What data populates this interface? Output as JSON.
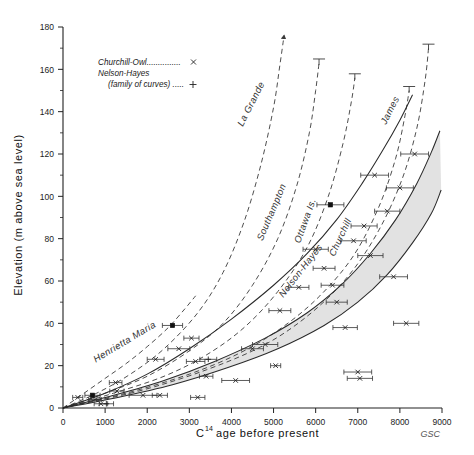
{
  "figure": {
    "credit": "GSC"
  },
  "legend": {
    "entries": [
      {
        "label": "Churchill-Owl...............",
        "marker": "x-marker-icon"
      },
      {
        "label": "Nelson-Hayes",
        "marker": ""
      },
      {
        "label": "(family of curves) .....",
        "marker": "plus-marker-icon"
      }
    ]
  },
  "chart_data": {
    "type": "line",
    "title": "",
    "xlabel": "C14 age before present",
    "xlabel_base": "C",
    "xlabel_sup": "14",
    "xlabel_rest": "age before present",
    "ylabel": "Elevation (m above sea level)",
    "xlim": [
      0,
      9000
    ],
    "ylim": [
      0,
      180
    ],
    "xticks": [
      0,
      1000,
      2000,
      3000,
      4000,
      5000,
      6000,
      7000,
      8000,
      9000
    ],
    "xtick_labels": [
      "0",
      "1000",
      "2000",
      "3000",
      "4000",
      "5000",
      "6000",
      "7000",
      "8000",
      "9000"
    ],
    "yticks": [
      0,
      20,
      40,
      60,
      80,
      100,
      120,
      140,
      160,
      180
    ],
    "ytick_labels": [
      "0",
      "20",
      "40",
      "60",
      "80",
      "100",
      "120",
      "140",
      "160",
      "180"
    ],
    "yticks_minor": [
      10,
      30,
      50,
      70,
      90,
      110,
      130,
      150,
      170
    ],
    "grid": false,
    "legend_position": "upper-left-inset",
    "series": [
      {
        "name": "Henrietta Maria",
        "style": "dashed",
        "label_x": 1500,
        "label_y": 30,
        "label_angle": -31,
        "points": [
          [
            0,
            0
          ],
          [
            500,
            7
          ],
          [
            1000,
            14
          ],
          [
            1500,
            21
          ],
          [
            2000,
            29
          ],
          [
            2500,
            38
          ],
          [
            2900,
            47
          ],
          [
            3150,
            53
          ]
        ]
      },
      {
        "name": "La Grande",
        "style": "dashed",
        "label_x": 4530,
        "label_y": 143,
        "label_angle": -63,
        "arrow_end": true,
        "points": [
          [
            0,
            0
          ],
          [
            800,
            7
          ],
          [
            1600,
            16
          ],
          [
            2400,
            28
          ],
          [
            3200,
            45
          ],
          [
            3800,
            64
          ],
          [
            4300,
            88
          ],
          [
            4700,
            115
          ],
          [
            5000,
            142
          ],
          [
            5150,
            162
          ],
          [
            5250,
            176
          ]
        ]
      },
      {
        "name": "Southampton",
        "style": "dashed",
        "cap_end": true,
        "label_x": 5020,
        "label_y": 92,
        "label_angle": -67,
        "points": [
          [
            0,
            0
          ],
          [
            1000,
            7
          ],
          [
            2000,
            15
          ],
          [
            3000,
            27
          ],
          [
            3800,
            40
          ],
          [
            4500,
            58
          ],
          [
            5100,
            80
          ],
          [
            5550,
            105
          ],
          [
            5850,
            130
          ],
          [
            6000,
            150
          ],
          [
            6080,
            163
          ]
        ]
      },
      {
        "name": "Ottawa Is.",
        "style": "dashed",
        "cap_end": true,
        "label_x": 5820,
        "label_y": 88,
        "label_angle": -70,
        "points": [
          [
            0,
            0
          ],
          [
            1200,
            7
          ],
          [
            2400,
            15
          ],
          [
            3400,
            25
          ],
          [
            4300,
            38
          ],
          [
            5100,
            55
          ],
          [
            5800,
            76
          ],
          [
            6300,
            100
          ],
          [
            6650,
            125
          ],
          [
            6850,
            145
          ],
          [
            6930,
            156
          ]
        ]
      },
      {
        "name": "Churchill",
        "style": "dashed",
        "cap_end": true,
        "label_x": 6650,
        "label_y": 80,
        "label_angle": -65,
        "points": [
          [
            0,
            0
          ],
          [
            1500,
            7
          ],
          [
            3000,
            16
          ],
          [
            4200,
            26
          ],
          [
            5200,
            38
          ],
          [
            6100,
            53
          ],
          [
            6900,
            72
          ],
          [
            7500,
            95
          ],
          [
            7900,
            118
          ],
          [
            8120,
            138
          ],
          [
            8220,
            150
          ]
        ]
      },
      {
        "name": "James",
        "style": "dashed",
        "cap_end": true,
        "label_x": 7830,
        "label_y": 140,
        "label_angle": -63,
        "points": [
          [
            0,
            0
          ],
          [
            1800,
            8
          ],
          [
            3400,
            18
          ],
          [
            4800,
            30
          ],
          [
            5900,
            45
          ],
          [
            6800,
            63
          ],
          [
            7500,
            84
          ],
          [
            8050,
            108
          ],
          [
            8400,
            132
          ],
          [
            8600,
            155
          ],
          [
            8680,
            170
          ]
        ]
      },
      {
        "name": "Churchill-Owl",
        "style": "solid",
        "points": [
          [
            0,
            0
          ],
          [
            1000,
            7
          ],
          [
            2000,
            16
          ],
          [
            3000,
            28
          ],
          [
            4000,
            42
          ],
          [
            5000,
            58
          ],
          [
            5800,
            73
          ],
          [
            6500,
            89
          ],
          [
            7100,
            106
          ],
          [
            7600,
            122
          ],
          [
            8000,
            136
          ],
          [
            8300,
            148
          ]
        ]
      },
      {
        "name": "Nelson-Hayes upper",
        "style": "solid",
        "points": [
          [
            0,
            0
          ],
          [
            1200,
            6
          ],
          [
            2400,
            13
          ],
          [
            3600,
            22
          ],
          [
            4800,
            33
          ],
          [
            5800,
            45
          ],
          [
            6600,
            58
          ],
          [
            7300,
            73
          ],
          [
            7900,
            89
          ],
          [
            8400,
            106
          ],
          [
            8750,
            121
          ],
          [
            8950,
            131
          ]
        ]
      },
      {
        "name": "Nelson-Hayes lower",
        "style": "solid",
        "points": [
          [
            0,
            0
          ],
          [
            1300,
            5
          ],
          [
            2600,
            11
          ],
          [
            3900,
            19
          ],
          [
            5100,
            28
          ],
          [
            6200,
            39
          ],
          [
            7000,
            50
          ],
          [
            7700,
            63
          ],
          [
            8300,
            78
          ],
          [
            8750,
            92
          ],
          [
            8980,
            103
          ]
        ]
      }
    ],
    "band": {
      "name": "Nelson-Hayes family envelope",
      "label": "Nelson-Hayes",
      "label_x": 5700,
      "label_y": 64,
      "label_angle": -52
    },
    "data_points": [
      {
        "x": 350,
        "y": 5,
        "xerr": 120,
        "marker": "x"
      },
      {
        "x": 700,
        "y": 6,
        "xerr": 180,
        "marker": "box"
      },
      {
        "x": 760,
        "y": 4,
        "xerr": 150,
        "marker": "x"
      },
      {
        "x": 900,
        "y": 2,
        "xerr": 160,
        "marker": "x"
      },
      {
        "x": 1030,
        "y": 2,
        "xerr": 170,
        "marker": "plus"
      },
      {
        "x": 1250,
        "y": 12,
        "xerr": 150,
        "marker": "x"
      },
      {
        "x": 1280,
        "y": 8,
        "xerr": 170,
        "marker": "x"
      },
      {
        "x": 1900,
        "y": 6,
        "xerr": 330,
        "marker": "x"
      },
      {
        "x": 2200,
        "y": 23,
        "xerr": 200,
        "marker": "x"
      },
      {
        "x": 2300,
        "y": 6,
        "xerr": 180,
        "marker": "x"
      },
      {
        "x": 2600,
        "y": 39,
        "xerr": 240,
        "marker": "box"
      },
      {
        "x": 2750,
        "y": 28,
        "xerr": 260,
        "marker": "x"
      },
      {
        "x": 3050,
        "y": 33,
        "xerr": 180,
        "marker": "x"
      },
      {
        "x": 3150,
        "y": 22,
        "xerr": 220,
        "marker": "x"
      },
      {
        "x": 3200,
        "y": 5,
        "xerr": 170,
        "marker": "x"
      },
      {
        "x": 3400,
        "y": 15,
        "xerr": 160,
        "marker": "x"
      },
      {
        "x": 3450,
        "y": 23,
        "xerr": 200,
        "marker": "plus"
      },
      {
        "x": 4100,
        "y": 13,
        "xerr": 330,
        "marker": "x"
      },
      {
        "x": 4500,
        "y": 28,
        "xerr": 260,
        "marker": "x"
      },
      {
        "x": 4800,
        "y": 30,
        "xerr": 300,
        "marker": "x"
      },
      {
        "x": 5050,
        "y": 20,
        "xerr": 120,
        "marker": "x"
      },
      {
        "x": 5150,
        "y": 46,
        "xerr": 260,
        "marker": "x"
      },
      {
        "x": 5600,
        "y": 57,
        "xerr": 240,
        "marker": "x"
      },
      {
        "x": 6000,
        "y": 75,
        "xerr": 300,
        "marker": "x"
      },
      {
        "x": 6200,
        "y": 66,
        "xerr": 260,
        "marker": "x"
      },
      {
        "x": 6350,
        "y": 96,
        "xerr": 320,
        "marker": "box"
      },
      {
        "x": 6400,
        "y": 58,
        "xerr": 270,
        "marker": "x"
      },
      {
        "x": 6500,
        "y": 50,
        "xerr": 250,
        "marker": "x"
      },
      {
        "x": 6700,
        "y": 38,
        "xerr": 290,
        "marker": "x"
      },
      {
        "x": 6900,
        "y": 79,
        "xerr": 300,
        "marker": "x"
      },
      {
        "x": 7000,
        "y": 17,
        "xerr": 330,
        "marker": "x"
      },
      {
        "x": 7050,
        "y": 14,
        "xerr": 300,
        "marker": "x"
      },
      {
        "x": 7150,
        "y": 86,
        "xerr": 310,
        "marker": "x"
      },
      {
        "x": 7300,
        "y": 72,
        "xerr": 300,
        "marker": "x"
      },
      {
        "x": 7400,
        "y": 110,
        "xerr": 330,
        "marker": "x"
      },
      {
        "x": 7700,
        "y": 93,
        "xerr": 300,
        "marker": "x"
      },
      {
        "x": 7850,
        "y": 62,
        "xerr": 330,
        "marker": "x"
      },
      {
        "x": 8000,
        "y": 104,
        "xerr": 320,
        "marker": "x"
      },
      {
        "x": 8150,
        "y": 40,
        "xerr": 300,
        "marker": "x"
      },
      {
        "x": 8350,
        "y": 120,
        "xerr": 330,
        "marker": "x"
      }
    ]
  }
}
